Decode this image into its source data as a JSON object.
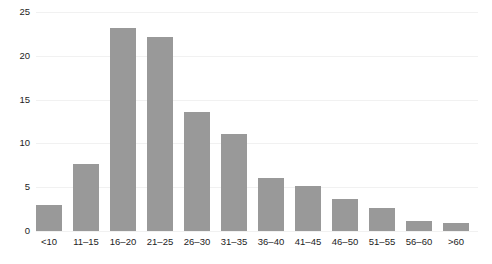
{
  "chart_data": {
    "type": "bar",
    "title": "",
    "subtitle": "",
    "xlabel": "",
    "ylabel": "",
    "categories": [
      "<10",
      "11–15",
      "16–20",
      "21–25",
      "26–30",
      "31–35",
      "36–40",
      "41–45",
      "46–50",
      "51–55",
      "56–60",
      ">60"
    ],
    "values": [
      3.0,
      7.7,
      23.2,
      22.1,
      13.6,
      11.1,
      6.1,
      5.1,
      3.6,
      2.6,
      1.1,
      0.9
    ],
    "series": [
      {
        "name": "",
        "values": [
          3.0,
          7.7,
          23.2,
          22.1,
          13.6,
          11.1,
          6.1,
          5.1,
          3.6,
          2.6,
          1.1,
          0.9
        ]
      }
    ],
    "ylim": [
      0,
      25
    ],
    "yticks": [
      0,
      5,
      10,
      15,
      20,
      25
    ],
    "ytick_labels": [
      "0",
      "5",
      "10",
      "15",
      "20",
      "25"
    ],
    "grid": "horizontal",
    "legend": "none",
    "bar_color": "#999999",
    "gridline_color": "#f1f1f1",
    "background_color": "#ffffff",
    "text_color": "#1d1d1d",
    "annotations": []
  }
}
